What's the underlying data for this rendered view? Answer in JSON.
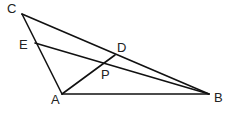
{
  "diagram": {
    "type": "geometry",
    "points": {
      "A": {
        "label": "A",
        "x": 62,
        "y": 94
      },
      "B": {
        "label": "B",
        "x": 209,
        "y": 94
      },
      "C": {
        "label": "C",
        "x": 22,
        "y": 14
      },
      "D": {
        "label": "D",
        "x": 115,
        "y": 55
      },
      "E": {
        "label": "E",
        "x": 35,
        "y": 43
      },
      "P": {
        "label": "P",
        "x": 105,
        "y": 63
      }
    },
    "segments": [
      {
        "from": "C",
        "to": "A"
      },
      {
        "from": "C",
        "to": "B"
      },
      {
        "from": "A",
        "to": "B"
      },
      {
        "from": "E",
        "to": "B"
      },
      {
        "from": "A",
        "to": "D"
      }
    ],
    "stroke_color": "#111111"
  }
}
